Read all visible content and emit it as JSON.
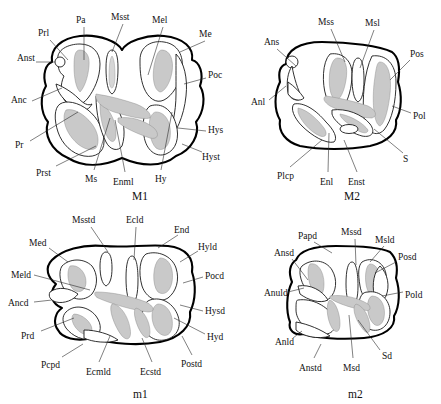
{
  "figure": {
    "kind": "line-drawing-plate",
    "colors": {
      "outline": "#000000",
      "inner_line": "#1a1a1a",
      "dentine_fill": "#c9c9c9",
      "leader_line": "#2b2b2b",
      "background": "#ffffff",
      "text": "#111111"
    }
  },
  "panels": [
    {
      "id": "M1",
      "title": "M1",
      "title_pos": {
        "x": 132,
        "y": 190
      },
      "labels": [
        {
          "text": "Prl",
          "x": 38,
          "y": 29,
          "tx": 49,
          "ty": 39,
          "lx1": 50,
          "ly1": 40,
          "lx2": 68,
          "ly2": 60
        },
        {
          "text": "Pa",
          "x": 76,
          "y": 16,
          "tx": 83,
          "ty": 26,
          "lx1": 84,
          "ly1": 27,
          "lx2": 84,
          "ly2": 60
        },
        {
          "text": "Msst",
          "x": 111,
          "y": 13,
          "tx": 122,
          "ty": 23,
          "lx1": 123,
          "ly1": 24,
          "lx2": 112,
          "ly2": 52
        },
        {
          "text": "Mel",
          "x": 152,
          "y": 16,
          "tx": 162,
          "ty": 26,
          "lx1": 163,
          "ly1": 27,
          "lx2": 148,
          "ly2": 75
        },
        {
          "text": "Me",
          "x": 199,
          "y": 30,
          "tx": 207,
          "ty": 40,
          "lx1": 205,
          "ly1": 41,
          "lx2": 180,
          "ly2": 52
        },
        {
          "text": "Anst",
          "x": 17,
          "y": 54,
          "tx": 35,
          "ty": 62,
          "lx1": 36,
          "ly1": 62,
          "lx2": 55,
          "ly2": 62
        },
        {
          "text": "Poc",
          "x": 208,
          "y": 71,
          "tx": 207,
          "ty": 77,
          "lx1": 206,
          "ly1": 78,
          "lx2": 184,
          "ly2": 84
        },
        {
          "text": "Anc",
          "x": 11,
          "y": 96,
          "tx": 31,
          "ty": 103,
          "lx1": 32,
          "ly1": 101,
          "lx2": 62,
          "ly2": 88
        },
        {
          "text": "Hys",
          "x": 208,
          "y": 126,
          "tx": 207,
          "ty": 130,
          "lx1": 206,
          "ly1": 131,
          "lx2": 178,
          "ly2": 128
        },
        {
          "text": "Pr",
          "x": 15,
          "y": 141,
          "tx": 29,
          "ty": 142,
          "lx1": 30,
          "ly1": 141,
          "lx2": 78,
          "ly2": 112
        },
        {
          "text": "Hyst",
          "x": 202,
          "y": 153,
          "tx": 203,
          "ty": 151,
          "lx1": 202,
          "ly1": 152,
          "lx2": 182,
          "ly2": 144
        },
        {
          "text": "Prst",
          "x": 36,
          "y": 169,
          "tx": 55,
          "ty": 169,
          "lx1": 56,
          "ly1": 166,
          "lx2": 96,
          "ly2": 146
        },
        {
          "text": "Ms",
          "x": 85,
          "y": 175,
          "tx": 93,
          "ty": 172,
          "lx1": 94,
          "ly1": 170,
          "lx2": 110,
          "ly2": 118
        },
        {
          "text": "Enml",
          "x": 113,
          "y": 178,
          "tx": 124,
          "ty": 174,
          "lx1": 125,
          "ly1": 172,
          "lx2": 115,
          "ly2": 120
        },
        {
          "text": "Hy",
          "x": 155,
          "y": 175,
          "tx": 160,
          "ty": 172,
          "lx1": 161,
          "ly1": 170,
          "lx2": 172,
          "ly2": 112
        }
      ]
    },
    {
      "id": "M2",
      "title": "M2",
      "title_pos": {
        "x": 344,
        "y": 190
      },
      "labels": [
        {
          "text": "Mss",
          "x": 318,
          "y": 18,
          "tx": 330,
          "ty": 28,
          "lx1": 331,
          "ly1": 29,
          "lx2": 345,
          "ly2": 62
        },
        {
          "text": "Msl",
          "x": 365,
          "y": 19,
          "tx": 375,
          "ty": 29,
          "lx1": 374,
          "ly1": 30,
          "lx2": 360,
          "ly2": 68
        },
        {
          "text": "Ans",
          "x": 264,
          "y": 38,
          "tx": 276,
          "ty": 48,
          "lx1": 277,
          "ly1": 49,
          "lx2": 296,
          "ly2": 66
        },
        {
          "text": "Pos",
          "x": 410,
          "y": 50,
          "tx": 411,
          "ty": 60,
          "lx1": 410,
          "ly1": 60,
          "lx2": 390,
          "ly2": 80
        },
        {
          "text": "Anl",
          "x": 251,
          "y": 98,
          "tx": 268,
          "ty": 102,
          "lx1": 269,
          "ly1": 100,
          "lx2": 286,
          "ly2": 86
        },
        {
          "text": "Pol",
          "x": 413,
          "y": 112,
          "tx": 412,
          "ty": 113,
          "lx1": 411,
          "ly1": 113,
          "lx2": 392,
          "ly2": 106
        },
        {
          "text": "S",
          "x": 403,
          "y": 155,
          "tx": 404,
          "ty": 153,
          "lx1": 403,
          "ly1": 153,
          "lx2": 374,
          "ly2": 129
        },
        {
          "text": "Plcp",
          "x": 277,
          "y": 172,
          "tx": 289,
          "ty": 168,
          "lx1": 290,
          "ly1": 167,
          "lx2": 322,
          "ly2": 140
        },
        {
          "text": "Enl",
          "x": 320,
          "y": 178,
          "tx": 327,
          "ty": 174,
          "lx1": 328,
          "ly1": 172,
          "lx2": 329,
          "ly2": 133
        },
        {
          "text": "Enst",
          "x": 348,
          "y": 178,
          "tx": 358,
          "ty": 174,
          "lx1": 357,
          "ly1": 172,
          "lx2": 344,
          "ly2": 140
        }
      ]
    },
    {
      "id": "m1",
      "title": "m1",
      "title_pos": {
        "x": 133,
        "y": 388
      },
      "labels": [
        {
          "text": "Msstd",
          "x": 72,
          "y": 216,
          "tx": 90,
          "ty": 226,
          "lx1": 91,
          "ly1": 227,
          "lx2": 108,
          "ly2": 252
        },
        {
          "text": "Ecld",
          "x": 126,
          "y": 216,
          "tx": 136,
          "ty": 226,
          "lx1": 136,
          "ly1": 227,
          "lx2": 134,
          "ly2": 260
        },
        {
          "text": "End",
          "x": 174,
          "y": 226,
          "tx": 180,
          "ty": 234,
          "lx1": 178,
          "ly1": 235,
          "lx2": 158,
          "ly2": 248
        },
        {
          "text": "Med",
          "x": 29,
          "y": 239,
          "tx": 48,
          "ty": 247,
          "lx1": 49,
          "ly1": 248,
          "lx2": 68,
          "ly2": 262
        },
        {
          "text": "Hyld",
          "x": 198,
          "y": 243,
          "tx": 199,
          "ty": 250,
          "lx1": 198,
          "ly1": 251,
          "lx2": 180,
          "ly2": 262
        },
        {
          "text": "Meld",
          "x": 11,
          "y": 271,
          "tx": 33,
          "ty": 276,
          "lx1": 34,
          "ly1": 275,
          "lx2": 90,
          "ly2": 290
        },
        {
          "text": "Pocd",
          "x": 205,
          "y": 272,
          "tx": 204,
          "ty": 276,
          "lx1": 203,
          "ly1": 277,
          "lx2": 183,
          "ly2": 283
        },
        {
          "text": "Ancd",
          "x": 8,
          "y": 299,
          "tx": 33,
          "ty": 303,
          "lx1": 34,
          "ly1": 302,
          "lx2": 52,
          "ly2": 300
        },
        {
          "text": "Hysd",
          "x": 205,
          "y": 307,
          "tx": 204,
          "ty": 310,
          "lx1": 203,
          "ly1": 311,
          "lx2": 180,
          "ly2": 305
        },
        {
          "text": "Prd",
          "x": 21,
          "y": 332,
          "tx": 40,
          "ty": 333,
          "lx1": 41,
          "ly1": 331,
          "lx2": 74,
          "ly2": 318
        },
        {
          "text": "Hyd",
          "x": 207,
          "y": 333,
          "tx": 206,
          "ty": 334,
          "lx1": 205,
          "ly1": 334,
          "lx2": 174,
          "ly2": 318
        },
        {
          "text": "Pcpd",
          "x": 41,
          "y": 361,
          "tx": 61,
          "ty": 360,
          "lx1": 62,
          "ly1": 357,
          "lx2": 83,
          "ly2": 344
        },
        {
          "text": "Ecmld",
          "x": 86,
          "y": 368,
          "tx": 98,
          "ty": 364,
          "lx1": 99,
          "ly1": 362,
          "lx2": 110,
          "ly2": 336
        },
        {
          "text": "Ecstd",
          "x": 140,
          "y": 368,
          "tx": 152,
          "ty": 364,
          "lx1": 152,
          "ly1": 362,
          "lx2": 142,
          "ly2": 338
        },
        {
          "text": "Postd",
          "x": 181,
          "y": 360,
          "tx": 192,
          "ty": 357,
          "lx1": 192,
          "ly1": 355,
          "lx2": 182,
          "ly2": 336
        }
      ]
    },
    {
      "id": "m2",
      "title": "m2",
      "title_pos": {
        "x": 348,
        "y": 388
      },
      "labels": [
        {
          "text": "Papd",
          "x": 298,
          "y": 232,
          "tx": 313,
          "ty": 241,
          "lx1": 314,
          "ly1": 242,
          "lx2": 332,
          "ly2": 253
        },
        {
          "text": "Mssd",
          "x": 341,
          "y": 228,
          "tx": 354,
          "ty": 238,
          "lx1": 355,
          "ly1": 239,
          "lx2": 356,
          "ly2": 265
        },
        {
          "text": "Msld",
          "x": 375,
          "y": 236,
          "tx": 385,
          "ty": 245,
          "lx1": 384,
          "ly1": 246,
          "lx2": 370,
          "ly2": 262
        },
        {
          "text": "Ansd",
          "x": 274,
          "y": 249,
          "tx": 291,
          "ty": 258,
          "lx1": 292,
          "ly1": 259,
          "lx2": 308,
          "ly2": 280
        },
        {
          "text": "Posd",
          "x": 398,
          "y": 253,
          "tx": 397,
          "ty": 261,
          "lx1": 396,
          "ly1": 262,
          "lx2": 375,
          "ly2": 273
        },
        {
          "text": "Anuld",
          "x": 264,
          "y": 289,
          "tx": 287,
          "ty": 293,
          "lx1": 288,
          "ly1": 292,
          "lx2": 304,
          "ly2": 288
        },
        {
          "text": "Pold",
          "x": 405,
          "y": 291,
          "tx": 404,
          "ty": 292,
          "lx1": 403,
          "ly1": 292,
          "lx2": 382,
          "ly2": 296
        },
        {
          "text": "Anld",
          "x": 275,
          "y": 338,
          "tx": 292,
          "ty": 340,
          "lx1": 293,
          "ly1": 338,
          "lx2": 302,
          "ly2": 331
        },
        {
          "text": "Sd",
          "x": 382,
          "y": 352,
          "tx": 381,
          "ty": 350,
          "lx1": 380,
          "ly1": 350,
          "lx2": 358,
          "ly2": 320
        },
        {
          "text": "Anstd",
          "x": 299,
          "y": 364,
          "tx": 313,
          "ty": 360,
          "lx1": 314,
          "ly1": 358,
          "lx2": 321,
          "ly2": 344
        },
        {
          "text": "Msd",
          "x": 343,
          "y": 364,
          "tx": 353,
          "ty": 360,
          "lx1": 353,
          "ly1": 358,
          "lx2": 349,
          "ly2": 315
        }
      ]
    }
  ]
}
